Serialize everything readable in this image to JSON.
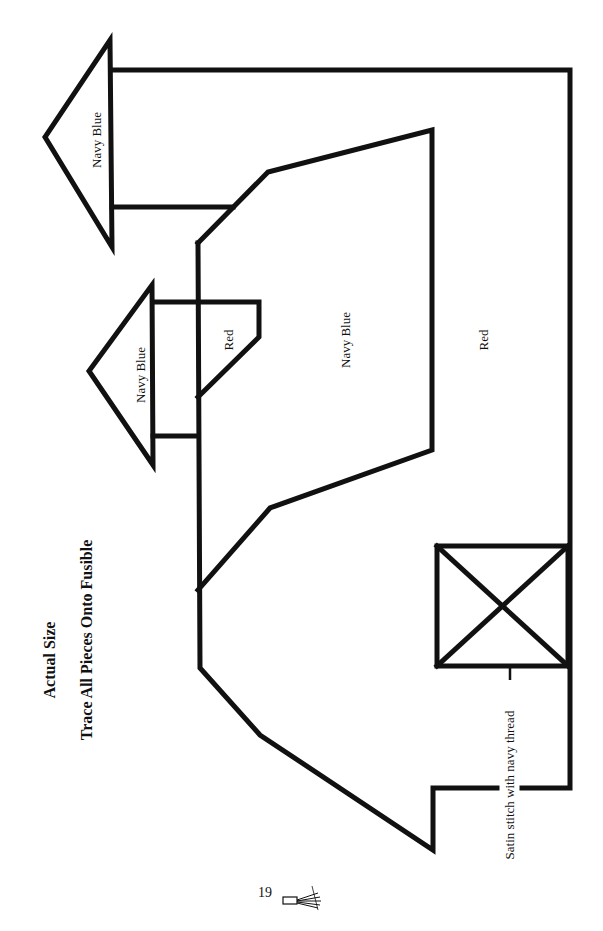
{
  "heading": {
    "line1": "Actual Size",
    "line2": "Trace All Pieces Onto Fusible"
  },
  "pieces": [
    {
      "id": "large-arrow",
      "label": "Navy Blue"
    },
    {
      "id": "small-arrow",
      "label": "Navy Blue"
    },
    {
      "id": "small-block",
      "label": "Red"
    },
    {
      "id": "center-body",
      "label": "Navy Blue"
    },
    {
      "id": "outer-body",
      "label": "Red"
    }
  ],
  "annotation": "Satin stitch with navy thread",
  "footer": {
    "page_number": "19",
    "ornament": "tassel-icon"
  },
  "colors": {
    "line": "#111111",
    "background": "#ffffff"
  }
}
